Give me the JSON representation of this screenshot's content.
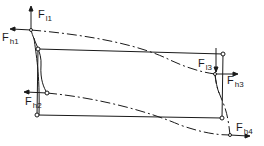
{
  "diagram": {
    "colors": {
      "line": "#1a1a1a",
      "background": "#ffffff"
    },
    "frame": {
      "corners": [
        [
          38,
          49
        ],
        [
          223,
          54
        ],
        [
          222,
          118
        ],
        [
          37,
          115
        ]
      ]
    },
    "nodes": {
      "n1": [
        31,
        30
      ],
      "n2": [
        47,
        93
      ],
      "n3": [
        215,
        74
      ],
      "n4": [
        230,
        135
      ]
    },
    "forces": [
      {
        "id": "Fl1",
        "base": "F",
        "sub": "l1",
        "direction": "up",
        "x": 38,
        "y": 9
      },
      {
        "id": "Fh1",
        "base": "F",
        "sub": "h1",
        "direction": "left",
        "x": 2,
        "y": 32
      },
      {
        "id": "Fh2",
        "base": "F",
        "sub": "h2",
        "direction": "left",
        "x": 25,
        "y": 96
      },
      {
        "id": "Fl3",
        "base": "F",
        "sub": "l3",
        "direction": "down",
        "x": 198,
        "y": 58
      },
      {
        "id": "Fh3",
        "base": "F",
        "sub": "h3",
        "direction": "right",
        "x": 227,
        "y": 75
      },
      {
        "id": "Fh4",
        "base": "F",
        "sub": "h4",
        "direction": "right",
        "x": 236,
        "y": 122
      }
    ]
  }
}
